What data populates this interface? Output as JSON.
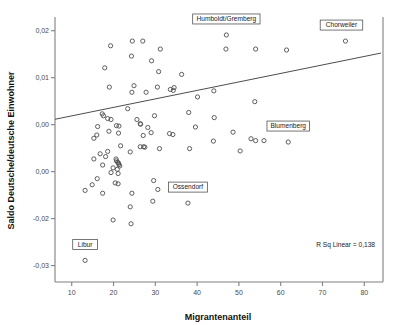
{
  "chart_data": {
    "type": "scatter",
    "title": "",
    "xlabel": "Migrantenanteil",
    "ylabel": "Saldo Deutsche/deutsche Einwohner",
    "xlim": [
      6,
      84
    ],
    "ylim": [
      -0.0335,
      0.0225
    ],
    "xticks": [
      10,
      20,
      30,
      40,
      50,
      60,
      70,
      80
    ],
    "xticklabels": [
      "10",
      "20",
      "30",
      "40",
      "50",
      "60",
      "70",
      "80"
    ],
    "yticks": [
      0.02,
      0.01,
      0.0,
      -0.01,
      -0.02,
      -0.03
    ],
    "yticklabels": [
      "0,02",
      "0,01",
      "0,00",
      "0,00",
      "-0,02",
      "-0,03"
    ],
    "grid": false,
    "legend": null,
    "annotation": "R Sq Linear = 0,138",
    "r_squared": 0.138,
    "fit_line": {
      "type": "linear",
      "x_start": 6,
      "y_start": 0.00115,
      "x_end": 84,
      "y_end": 0.01525
    },
    "marker": "open-circle",
    "point_labels": [
      {
        "label": "Humboldt/Gremberg",
        "x": 47.0,
        "y": 0.0191
      },
      {
        "label": "Chorweiler",
        "x": 75.5,
        "y": 0.0178
      },
      {
        "label": "Blumenberg",
        "x": 61.8,
        "y": -0.0037
      },
      {
        "label": "Ossendorf",
        "x": 37.8,
        "y": -0.0167
      },
      {
        "label": "Libur",
        "x": 13.2,
        "y": -0.0289
      }
    ],
    "points": [
      {
        "x": 19.3,
        "y": 0.0168
      },
      {
        "x": 24.5,
        "y": 0.0178
      },
      {
        "x": 27.0,
        "y": 0.0178
      },
      {
        "x": 47.0,
        "y": 0.0191
      },
      {
        "x": 75.5,
        "y": 0.0178
      },
      {
        "x": 17.9,
        "y": 0.0121
      },
      {
        "x": 24.3,
        "y": 0.0146
      },
      {
        "x": 29.1,
        "y": 0.0136
      },
      {
        "x": 31.2,
        "y": 0.0161
      },
      {
        "x": 46.9,
        "y": 0.0161
      },
      {
        "x": 54.0,
        "y": 0.0161
      },
      {
        "x": 61.4,
        "y": 0.0159
      },
      {
        "x": 30.8,
        "y": 0.0113
      },
      {
        "x": 36.3,
        "y": 0.0107
      },
      {
        "x": 19.0,
        "y": 0.008
      },
      {
        "x": 24.4,
        "y": 0.0069
      },
      {
        "x": 24.9,
        "y": 0.0083
      },
      {
        "x": 27.8,
        "y": 0.0069
      },
      {
        "x": 30.5,
        "y": 0.008
      },
      {
        "x": 33.6,
        "y": 0.0075
      },
      {
        "x": 34.3,
        "y": 0.0073
      },
      {
        "x": 34.5,
        "y": 0.0079
      },
      {
        "x": 40.1,
        "y": 0.0059
      },
      {
        "x": 44.0,
        "y": 0.0072
      },
      {
        "x": 53.8,
        "y": 0.0049
      },
      {
        "x": 23.4,
        "y": 0.0034
      },
      {
        "x": 29.8,
        "y": 0.0019
      },
      {
        "x": 38.0,
        "y": 0.0026
      },
      {
        "x": 44.1,
        "y": 0.0015
      },
      {
        "x": 17.3,
        "y": 0.0023
      },
      {
        "x": 17.6,
        "y": 0.0019
      },
      {
        "x": 18.6,
        "y": 0.0013
      },
      {
        "x": 19.4,
        "y": 0.0011
      },
      {
        "x": 16.2,
        "y": -0.0004
      },
      {
        "x": 20.7,
        "y": -0.0002
      },
      {
        "x": 21.3,
        "y": -0.0003
      },
      {
        "x": 25.6,
        "y": 0.0011
      },
      {
        "x": 26.4,
        "y": 0.0002
      },
      {
        "x": 26.5,
        "y": 0.0001
      },
      {
        "x": 28.2,
        "y": -0.0006
      },
      {
        "x": 39.6,
        "y": -0.0005
      },
      {
        "x": 18.9,
        "y": -0.0014
      },
      {
        "x": 21.2,
        "y": -0.0018
      },
      {
        "x": 27.1,
        "y": -0.0023
      },
      {
        "x": 29.0,
        "y": -0.0017
      },
      {
        "x": 33.4,
        "y": -0.0019
      },
      {
        "x": 34.2,
        "y": -0.0021
      },
      {
        "x": 48.6,
        "y": -0.0016
      },
      {
        "x": 15.3,
        "y": -0.0029
      },
      {
        "x": 16.0,
        "y": -0.0022
      },
      {
        "x": 43.9,
        "y": -0.0035
      },
      {
        "x": 52.9,
        "y": -0.003
      },
      {
        "x": 54.0,
        "y": -0.0034
      },
      {
        "x": 56.0,
        "y": -0.0034
      },
      {
        "x": 61.8,
        "y": -0.0037
      },
      {
        "x": 21.7,
        "y": -0.0045
      },
      {
        "x": 26.4,
        "y": -0.0047
      },
      {
        "x": 27.2,
        "y": -0.0047
      },
      {
        "x": 27.5,
        "y": -0.0048
      },
      {
        "x": 31.0,
        "y": -0.0051
      },
      {
        "x": 38.2,
        "y": -0.0051
      },
      {
        "x": 50.3,
        "y": -0.0056
      },
      {
        "x": 16.8,
        "y": -0.0062
      },
      {
        "x": 18.6,
        "y": -0.0057
      },
      {
        "x": 24.0,
        "y": -0.0058
      },
      {
        "x": 15.3,
        "y": -0.0073
      },
      {
        "x": 18.1,
        "y": -0.0068
      },
      {
        "x": 20.6,
        "y": -0.0073
      },
      {
        "x": 20.7,
        "y": -0.0077
      },
      {
        "x": 21.0,
        "y": -0.008
      },
      {
        "x": 21.2,
        "y": -0.0082
      },
      {
        "x": 21.3,
        "y": -0.0085
      },
      {
        "x": 17.4,
        "y": -0.0086
      },
      {
        "x": 19.9,
        "y": -0.0092
      },
      {
        "x": 20.9,
        "y": -0.0095
      },
      {
        "x": 21.5,
        "y": -0.0088
      },
      {
        "x": 19.4,
        "y": -0.0102
      },
      {
        "x": 21.1,
        "y": -0.0104
      },
      {
        "x": 29.6,
        "y": -0.0119
      },
      {
        "x": 14.9,
        "y": -0.0128
      },
      {
        "x": 16.1,
        "y": -0.0115
      },
      {
        "x": 20.4,
        "y": -0.0124
      },
      {
        "x": 21.1,
        "y": -0.0126
      },
      {
        "x": 30.6,
        "y": -0.0138
      },
      {
        "x": 13.2,
        "y": -0.014
      },
      {
        "x": 17.4,
        "y": -0.0146
      },
      {
        "x": 24.4,
        "y": -0.0146
      },
      {
        "x": 37.8,
        "y": -0.0167
      },
      {
        "x": 29.4,
        "y": -0.0163
      },
      {
        "x": 24.0,
        "y": -0.0175
      },
      {
        "x": 19.9,
        "y": -0.0203
      },
      {
        "x": 24.2,
        "y": -0.0211
      },
      {
        "x": 13.2,
        "y": -0.0289
      }
    ]
  }
}
